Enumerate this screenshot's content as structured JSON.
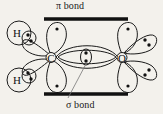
{
  "figure": {
    "kind": "orbital-bonding-diagram",
    "molecule": "formaldehyde",
    "background_color": "#f3f1ec",
    "ink_color": "#1a1a1a",
    "labels": {
      "pi_bond": "π bond",
      "sigma_bond": "σ bond"
    },
    "atoms": [
      {
        "id": "carbon",
        "symbol": "C",
        "x": 51,
        "y": 57
      },
      {
        "id": "oxygen",
        "symbol": "O",
        "x": 122,
        "y": 57
      },
      {
        "id": "hydrogen-upper",
        "symbol": "H",
        "x": 20,
        "y": 33
      },
      {
        "id": "hydrogen-lower",
        "symbol": "H",
        "x": 20,
        "y": 79
      }
    ],
    "electron_pairs": [
      {
        "id": "sigma-pair-cc",
        "dots": 2,
        "location": "between-carbon-and-oxygen"
      },
      {
        "id": "bonding-pair-h-upper",
        "dots": 2,
        "location": "upper-c-h-bond"
      },
      {
        "id": "bonding-pair-h-lower",
        "dots": 2,
        "location": "lower-c-h-bond"
      },
      {
        "id": "oxygen-lone-pair-upper",
        "dots": 2,
        "location": "oxygen-upper-right-lobe"
      },
      {
        "id": "oxygen-lone-pair-lower",
        "dots": 2,
        "location": "oxygen-lower-right-lobe"
      }
    ],
    "single_electrons": [
      {
        "id": "carbon-p-up",
        "dots": 1,
        "location": "carbon-upper-lobe"
      },
      {
        "id": "carbon-p-down",
        "dots": 1,
        "location": "carbon-lower-lobe"
      },
      {
        "id": "oxygen-p-up",
        "dots": 1,
        "location": "oxygen-upper-lobe"
      },
      {
        "id": "oxygen-p-down",
        "dots": 1,
        "location": "oxygen-lower-lobe"
      }
    ],
    "pi_bars": [
      {
        "id": "pi-bar-top",
        "x1": 44,
        "x2": 128,
        "y": 19
      },
      {
        "id": "pi-bar-bottom",
        "x1": 44,
        "x2": 128,
        "y": 94
      }
    ],
    "leader_lines": [
      {
        "id": "sigma-leader",
        "from_x": 68,
        "from_y": 97,
        "to_x": 86,
        "to_y": 62
      }
    ]
  }
}
